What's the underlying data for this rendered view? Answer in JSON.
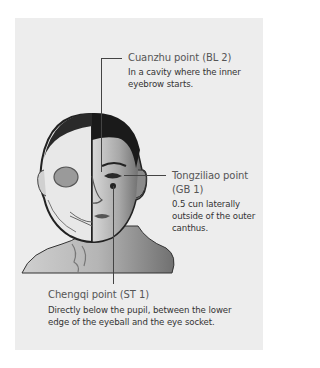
{
  "figure": {
    "points": [
      {
        "name": "Cuanzhu point (BL 2)",
        "description": "In a cavity where the inner eyebrow starts.",
        "description_lines": [
          "In a cavity where the inner",
          "eyebrow starts."
        ]
      },
      {
        "name": "Tongziliao point (GB 1)",
        "name_lines": [
          "Tongziliao point",
          "(GB 1)"
        ],
        "description": "0.5 cun laterally outside of the outer canthus.",
        "description_lines": [
          "0.5 cun laterally",
          "outside of the outer",
          "canthus."
        ]
      },
      {
        "name": "Chengqi point (ST 1)",
        "description": "Directly below the pupil, between the lower edge of the eyeball and the eye socket.",
        "description_lines": [
          "Directly below the pupil, between the lower",
          "edge of the eyeball and the eye socket."
        ]
      }
    ],
    "illustration": "half-skull-half-face-head",
    "colors": {
      "panel_bg": "#ededed",
      "leader_line": "#444444",
      "title_text": "#555555",
      "desc_text": "#333333"
    }
  }
}
